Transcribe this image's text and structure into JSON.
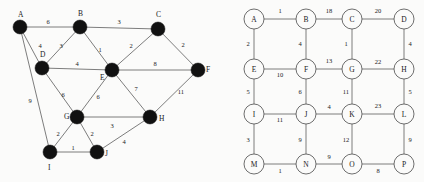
{
  "figure": {
    "type": "graph-diagram-pair",
    "background_color": "#fbfbfa",
    "edge_color": "#6e6e6e",
    "node_fill_left": "#111111",
    "node_fill_right": "#fbfbfa",
    "text_color": "#1a1a1a"
  },
  "left_graph": {
    "name": "irregular-weighted-graph",
    "node_style": "filled-black-disc",
    "node_radius": 7,
    "nodes": [
      {
        "id": "A",
        "label": "A",
        "x": 20,
        "y": 27,
        "label_x": 18,
        "label_y": 17
      },
      {
        "id": "B",
        "label": "B",
        "x": 80,
        "y": 27,
        "label_x": 78,
        "label_y": 16
      },
      {
        "id": "C",
        "label": "C",
        "x": 158,
        "y": 29,
        "label_x": 156,
        "label_y": 17
      },
      {
        "id": "D",
        "label": "D",
        "x": 42,
        "y": 68,
        "label_x": 40,
        "label_y": 57
      },
      {
        "id": "E",
        "label": "E",
        "x": 112,
        "y": 70,
        "label_x": 100,
        "label_y": 80
      },
      {
        "id": "F",
        "label": "F",
        "x": 198,
        "y": 70,
        "label_x": 206,
        "label_y": 72
      },
      {
        "id": "G",
        "label": "G",
        "x": 77,
        "y": 117,
        "label_x": 64,
        "label_y": 119
      },
      {
        "id": "H",
        "label": "H",
        "x": 150,
        "y": 117,
        "label_x": 159,
        "label_y": 121
      },
      {
        "id": "I",
        "label": "I",
        "x": 50,
        "y": 152,
        "label_x": 48,
        "label_y": 170
      },
      {
        "id": "J",
        "label": "J",
        "x": 97,
        "y": 152,
        "label_x": 105,
        "label_y": 156
      }
    ],
    "edges": [
      {
        "from": "A",
        "to": "B",
        "weight": "6",
        "wx": 48,
        "wy": 24
      },
      {
        "from": "A",
        "to": "D",
        "weight": "4",
        "wx": 40,
        "wy": 48
      },
      {
        "from": "A",
        "to": "I",
        "weight": "9",
        "wx": 30,
        "wy": 103
      },
      {
        "from": "B",
        "to": "C",
        "weight": "3",
        "wx": 119,
        "wy": 24
      },
      {
        "from": "B",
        "to": "D",
        "weight": "3",
        "wx": 61,
        "wy": 48
      },
      {
        "from": "B",
        "to": "E",
        "weight": "1",
        "wx": 100,
        "wy": 52
      },
      {
        "from": "C",
        "to": "E",
        "weight": "2",
        "wx": 131,
        "wy": 48
      },
      {
        "from": "C",
        "to": "F",
        "weight": "2",
        "wx": 183,
        "wy": 47
      },
      {
        "from": "D",
        "to": "E",
        "weight": "4",
        "wx": 77,
        "wy": 66
      },
      {
        "from": "D",
        "to": "G",
        "weight": "6",
        "wx": 63,
        "wy": 97
      },
      {
        "from": "E",
        "to": "F",
        "weight": "8",
        "wx": 155,
        "wy": 66
      },
      {
        "from": "E",
        "to": "G",
        "weight": "6",
        "wx": 98,
        "wy": 99
      },
      {
        "from": "E",
        "to": "H",
        "weight": "7",
        "wx": 136,
        "wy": 91
      },
      {
        "from": "F",
        "to": "H",
        "weight": "11",
        "wx": 181,
        "wy": 94
      },
      {
        "from": "G",
        "to": "H",
        "weight": "3",
        "wx": 112,
        "wy": 128
      },
      {
        "from": "G",
        "to": "I",
        "weight": "2",
        "wx": 58,
        "wy": 136
      },
      {
        "from": "G",
        "to": "J",
        "weight": "2",
        "wx": 92,
        "wy": 136
      },
      {
        "from": "H",
        "to": "J",
        "weight": "4",
        "wx": 124,
        "wy": 144
      },
      {
        "from": "I",
        "to": "J",
        "weight": "1",
        "wx": 73,
        "wy": 150
      }
    ]
  },
  "right_graph": {
    "name": "grid-weighted-graph",
    "node_style": "open-circle",
    "node_radius": 10,
    "nodes": [
      {
        "id": "A",
        "label": "A",
        "x": 42,
        "y": 19
      },
      {
        "id": "B",
        "label": "B",
        "x": 94,
        "y": 19
      },
      {
        "id": "C",
        "label": "C",
        "x": 140,
        "y": 19
      },
      {
        "id": "D",
        "label": "D",
        "x": 192,
        "y": 19
      },
      {
        "id": "E",
        "label": "E",
        "x": 42,
        "y": 69
      },
      {
        "id": "F",
        "label": "F",
        "x": 94,
        "y": 69
      },
      {
        "id": "G",
        "label": "G",
        "x": 140,
        "y": 69
      },
      {
        "id": "H",
        "label": "H",
        "x": 192,
        "y": 69
      },
      {
        "id": "I",
        "label": "I",
        "x": 42,
        "y": 114
      },
      {
        "id": "J",
        "label": "J",
        "x": 94,
        "y": 114
      },
      {
        "id": "K",
        "label": "K",
        "x": 140,
        "y": 114
      },
      {
        "id": "L",
        "label": "L",
        "x": 192,
        "y": 114
      },
      {
        "id": "M",
        "label": "M",
        "x": 42,
        "y": 164
      },
      {
        "id": "N",
        "label": "N",
        "x": 94,
        "y": 164
      },
      {
        "id": "O",
        "label": "O",
        "x": 140,
        "y": 164
      },
      {
        "id": "P",
        "label": "P",
        "x": 192,
        "y": 164
      }
    ],
    "edges": [
      {
        "from": "A",
        "to": "B",
        "weight": "1",
        "wx": 68,
        "wy": 13
      },
      {
        "from": "B",
        "to": "C",
        "weight": "18",
        "wx": 117,
        "wy": 13
      },
      {
        "from": "C",
        "to": "D",
        "weight": "20",
        "wx": 166,
        "wy": 13
      },
      {
        "from": "A",
        "to": "E",
        "weight": "2",
        "wx": 36,
        "wy": 46
      },
      {
        "from": "B",
        "to": "F",
        "weight": "4",
        "wx": 88,
        "wy": 46
      },
      {
        "from": "C",
        "to": "G",
        "weight": "1",
        "wx": 134,
        "wy": 46
      },
      {
        "from": "D",
        "to": "H",
        "weight": "4",
        "wx": 198,
        "wy": 46
      },
      {
        "from": "E",
        "to": "F",
        "weight": "10",
        "wx": 68,
        "wy": 77
      },
      {
        "from": "F",
        "to": "G",
        "weight": "13",
        "wx": 117,
        "wy": 63
      },
      {
        "from": "G",
        "to": "H",
        "weight": "22",
        "wx": 166,
        "wy": 64
      },
      {
        "from": "E",
        "to": "I",
        "weight": "5",
        "wx": 36,
        "wy": 94
      },
      {
        "from": "F",
        "to": "J",
        "weight": "6",
        "wx": 88,
        "wy": 94
      },
      {
        "from": "G",
        "to": "K",
        "weight": "11",
        "wx": 134,
        "wy": 94
      },
      {
        "from": "H",
        "to": "L",
        "weight": "5",
        "wx": 198,
        "wy": 94
      },
      {
        "from": "I",
        "to": "J",
        "weight": "11",
        "wx": 68,
        "wy": 122
      },
      {
        "from": "J",
        "to": "K",
        "weight": "4",
        "wx": 117,
        "wy": 109
      },
      {
        "from": "K",
        "to": "L",
        "weight": "23",
        "wx": 166,
        "wy": 108
      },
      {
        "from": "I",
        "to": "M",
        "weight": "3",
        "wx": 36,
        "wy": 142
      },
      {
        "from": "J",
        "to": "N",
        "weight": "9",
        "wx": 88,
        "wy": 142
      },
      {
        "from": "K",
        "to": "O",
        "weight": "12",
        "wx": 134,
        "wy": 142
      },
      {
        "from": "L",
        "to": "P",
        "weight": "9",
        "wx": 198,
        "wy": 142
      },
      {
        "from": "M",
        "to": "N",
        "weight": "1",
        "wx": 68,
        "wy": 173
      },
      {
        "from": "N",
        "to": "O",
        "weight": "9",
        "wx": 117,
        "wy": 159
      },
      {
        "from": "O",
        "to": "P",
        "weight": "8",
        "wx": 166,
        "wy": 173
      }
    ]
  }
}
